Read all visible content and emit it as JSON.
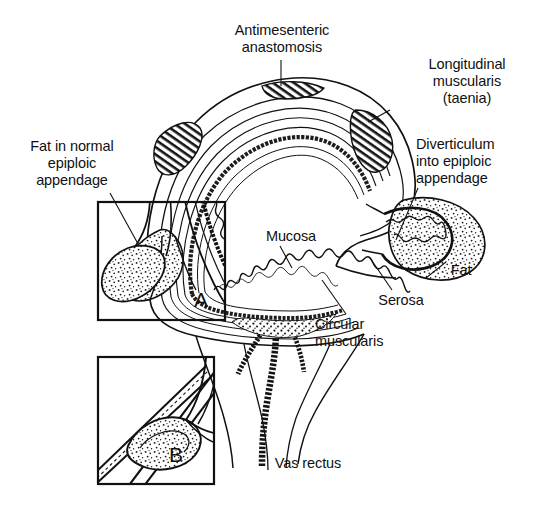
{
  "figure": {
    "ink_color": "#111111",
    "background_color": "#ffffff",
    "labels": {
      "antimesenteric": "Antimesenteric\nanastomosis",
      "longitudinal_muscularis": "Longitudinal\nmuscularis\n(taenia)",
      "fat_in_normal_epiploic_appendage": "Fat in normal\nepiploic\nappendage",
      "diverticulum_into_epiploic_appendage": "Diverticulum\ninto epiploic\nappendage",
      "mucosa": "Mucosa",
      "fat": "Fat",
      "serosa": "Serosa",
      "circular_muscularis": "Circular\nmuscularis",
      "vas_rectus": "Vas rectus"
    },
    "insets": [
      {
        "letter": "A",
        "caption": "Fat in normal epiploic appendage detail"
      },
      {
        "letter": "B",
        "caption": "Vas rectus and diverticulum detail"
      }
    ]
  }
}
